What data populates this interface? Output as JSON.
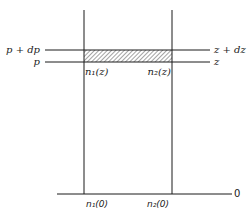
{
  "diagram": {
    "left_labels": {
      "upper": "p + dp",
      "lower": "p"
    },
    "right_labels": {
      "upper": "z + dz",
      "lower": "z"
    },
    "column_labels_at_z": {
      "left": "n₁(z)",
      "right": "n₂(z)"
    },
    "column_labels_at_zero": {
      "left": "n₁(0)",
      "right": "n₂(0)"
    },
    "baseline_label": "0",
    "colors": {
      "line": "#1a1a1a",
      "background": "#ffffff",
      "hatch": "#333333"
    }
  }
}
